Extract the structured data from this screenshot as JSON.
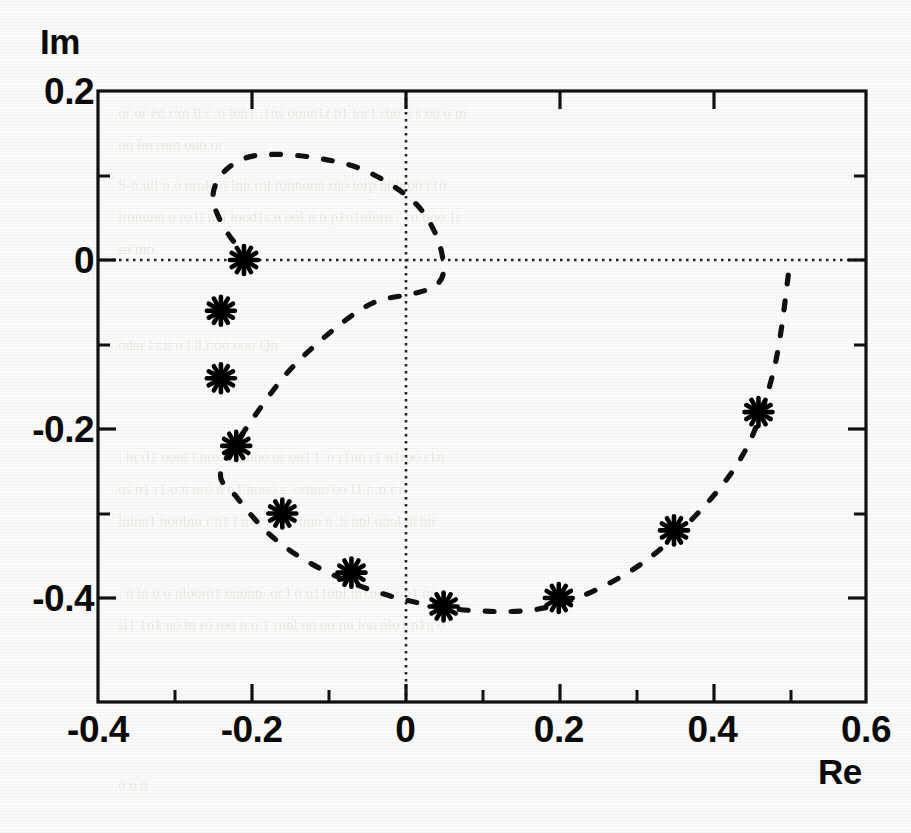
{
  "figure": {
    "y_axis_label": "Im",
    "x_axis_label": "Re",
    "frame_color": "#111111",
    "marker_color": "#000000",
    "curve_color": "#111111",
    "zero_line_color": "#222222"
  },
  "axes": {
    "x_ticks": [
      {
        "value": -0.4,
        "label": "-0.4"
      },
      {
        "value": -0.2,
        "label": "-0.2"
      },
      {
        "value": 0,
        "label": "0"
      },
      {
        "value": 0.2,
        "label": "0.2"
      },
      {
        "value": 0.4,
        "label": "0.4"
      },
      {
        "value": 0.6,
        "label": "0.6"
      }
    ],
    "y_ticks": [
      {
        "value": 0.2,
        "label": "0.2"
      },
      {
        "value": 0,
        "label": "0"
      },
      {
        "value": -0.2,
        "label": "-0.2"
      },
      {
        "value": -0.4,
        "label": "-0.4"
      }
    ],
    "x_minor_ticks": [
      -0.3,
      -0.1,
      0.1,
      0.3,
      0.5
    ],
    "y_minor_ticks": [
      0.1,
      -0.1,
      -0.3
    ]
  },
  "chart_data": {
    "type": "scatter",
    "title": "",
    "subtitle": "",
    "xlabel": "Re",
    "ylabel": "Im",
    "xlim": [
      -0.4,
      0.6
    ],
    "ylim": [
      -0.52,
      0.2
    ],
    "grid": false,
    "legend": null,
    "annotations": [],
    "series": [
      {
        "name": "estimated poles",
        "marker": "asterisk",
        "linestyle": "none",
        "x": [
          -0.21,
          -0.24,
          -0.24,
          -0.22,
          -0.16,
          -0.07,
          0.05,
          0.2,
          0.35,
          0.46
        ],
        "y": [
          0.0,
          -0.06,
          -0.14,
          -0.22,
          -0.3,
          -0.37,
          -0.41,
          -0.4,
          -0.32,
          -0.18
        ]
      },
      {
        "name": "unit-disc reference contour",
        "marker": "none",
        "linestyle": "dashed",
        "x": [
          -0.2,
          -0.23,
          -0.25,
          -0.24,
          -0.21,
          -0.17,
          -0.11,
          -0.05,
          0.01,
          0.04,
          0.05,
          0.04,
          0.01,
          -0.04,
          -0.09,
          -0.15,
          -0.2,
          -0.24,
          -0.22,
          -0.17,
          -0.1,
          -0.01,
          0.09,
          0.19,
          0.29,
          0.37,
          0.44,
          0.48,
          0.5
        ],
        "y": [
          0.0,
          0.03,
          0.07,
          0.1,
          0.12,
          0.125,
          0.12,
          0.105,
          0.07,
          0.03,
          -0.01,
          -0.03,
          -0.04,
          -0.05,
          -0.08,
          -0.13,
          -0.19,
          -0.25,
          -0.28,
          -0.33,
          -0.37,
          -0.4,
          -0.415,
          -0.41,
          -0.37,
          -0.31,
          -0.23,
          -0.13,
          -0.01
        ]
      }
    ]
  }
}
